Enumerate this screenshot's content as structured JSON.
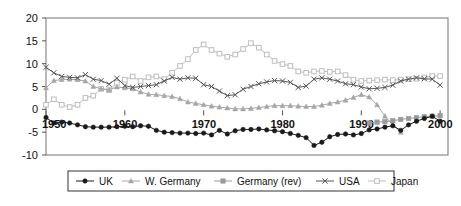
{
  "chart_data": {
    "type": "line",
    "title": "",
    "xlabel": "",
    "ylabel": "",
    "xlim": [
      1950,
      2001
    ],
    "ylim": [
      -10,
      20
    ],
    "yticks": [
      20,
      15,
      10,
      5,
      0,
      -5,
      -10
    ],
    "ytick_labels": [
      "20",
      "15",
      "10",
      "5",
      "0",
      "-5",
      "-10"
    ],
    "xticks": [
      1950,
      1960,
      1970,
      1980,
      1990,
      2000
    ],
    "xtick_labels": [
      "1950",
      "1960",
      "1970",
      "1980",
      "1990",
      "2000"
    ],
    "grid": false,
    "legend_position": "bottom",
    "series": [
      {
        "name": "UK",
        "color": "#1a1a1a",
        "marker": "filled-circle",
        "x": [
          1950,
          1951,
          1952,
          1953,
          1954,
          1955,
          1956,
          1957,
          1958,
          1959,
          1960,
          1961,
          1962,
          1963,
          1964,
          1965,
          1966,
          1967,
          1968,
          1969,
          1970,
          1971,
          1972,
          1973,
          1974,
          1975,
          1976,
          1977,
          1978,
          1979,
          1980,
          1981,
          1982,
          1983,
          1984,
          1985,
          1986,
          1987,
          1988,
          1989,
          1990,
          1991,
          1992,
          1993,
          1994,
          1995,
          1996,
          1997,
          1998,
          1999,
          2000
        ],
        "values": [
          -1.8,
          -3.0,
          -2.8,
          -3.0,
          -3.4,
          -3.8,
          -3.9,
          -3.9,
          -3.9,
          -3.8,
          -3.7,
          -3.8,
          -3.6,
          -3.7,
          -4.6,
          -5.0,
          -5.1,
          -5.2,
          -5.2,
          -5.3,
          -5.2,
          -5.6,
          -4.6,
          -5.4,
          -4.7,
          -4.4,
          -4.4,
          -4.3,
          -4.5,
          -4.7,
          -4.9,
          -5.3,
          -5.7,
          -6.2,
          -7.9,
          -7.2,
          -6.0,
          -5.5,
          -5.4,
          -5.6,
          -5.3,
          -4.5,
          -4.3,
          -3.9,
          -3.6,
          -4.6,
          -3.4,
          -2.6,
          -2.0,
          -1.5,
          -2.6
        ]
      },
      {
        "name": "W. Germany",
        "color": "#a6a6a6",
        "marker": "filled-triangle",
        "x": [
          1950,
          1951,
          1952,
          1953,
          1954,
          1955,
          1956,
          1957,
          1958,
          1959,
          1960,
          1961,
          1962,
          1963,
          1964,
          1965,
          1966,
          1967,
          1968,
          1969,
          1970,
          1971,
          1972,
          1973,
          1974,
          1975,
          1976,
          1977,
          1978,
          1979,
          1980,
          1981,
          1982,
          1983,
          1984,
          1985,
          1986,
          1987,
          1988,
          1989,
          1990,
          1991,
          1992,
          1993,
          1994,
          1995
        ],
        "values": [
          4.7,
          6.3,
          6.5,
          6.6,
          6.5,
          6.2,
          5.0,
          4.5,
          4.3,
          4.9,
          4.7,
          4.5,
          3.8,
          3.3,
          3.2,
          3.0,
          2.8,
          2.3,
          1.6,
          1.3,
          1.0,
          0.7,
          0.5,
          0.3,
          0.1,
          0.1,
          0.2,
          0.4,
          0.6,
          0.8,
          0.8,
          0.8,
          0.7,
          0.6,
          0.6,
          0.9,
          1.3,
          1.6,
          2.0,
          2.6,
          3.2,
          2.7,
          1.0,
          -1.5,
          -3.4,
          -5.0
        ]
      },
      {
        "name": "Germany (rev)",
        "color": "#9a9a9a",
        "marker": "filled-square",
        "x": [
          1991,
          1992,
          1993,
          1994,
          1995,
          1996,
          1997,
          1998,
          1999,
          2000
        ],
        "values": [
          -3.0,
          -2.8,
          -2.7,
          -2.5,
          -2.2,
          -2.0,
          -1.8,
          -1.6,
          -1.5,
          -1.4
        ]
      },
      {
        "name": "USA",
        "color": "#555555",
        "marker": "x-cross",
        "x": [
          1950,
          1951,
          1952,
          1953,
          1954,
          1955,
          1956,
          1957,
          1958,
          1959,
          1960,
          1961,
          1962,
          1963,
          1964,
          1965,
          1966,
          1967,
          1968,
          1969,
          1970,
          1971,
          1972,
          1973,
          1974,
          1975,
          1976,
          1977,
          1978,
          1979,
          1980,
          1981,
          1982,
          1983,
          1984,
          1985,
          1986,
          1987,
          1988,
          1989,
          1990,
          1991,
          1992,
          1993,
          1994,
          1995,
          1996,
          1997,
          1998,
          1999,
          2000
        ],
        "values": [
          9.2,
          8.0,
          7.2,
          7.0,
          6.9,
          7.6,
          6.6,
          6.3,
          5.5,
          6.8,
          5.2,
          4.8,
          5.0,
          5.2,
          5.4,
          6.2,
          7.0,
          6.6,
          6.9,
          6.8,
          5.4,
          5.0,
          4.0,
          3.0,
          3.2,
          4.4,
          5.0,
          5.6,
          6.0,
          6.3,
          6.2,
          5.9,
          4.8,
          5.1,
          6.6,
          6.9,
          6.6,
          6.2,
          5.6,
          5.4,
          4.9,
          4.5,
          4.6,
          4.8,
          5.3,
          6.2,
          6.6,
          6.9,
          6.7,
          6.6,
          5.3
        ]
      },
      {
        "name": "Japan",
        "color": "#bdbdbd",
        "marker": "open-square",
        "x": [
          1950,
          1951,
          1952,
          1953,
          1954,
          1955,
          1956,
          1957,
          1958,
          1959,
          1960,
          1961,
          1962,
          1963,
          1964,
          1965,
          1966,
          1967,
          1968,
          1969,
          1970,
          1971,
          1972,
          1973,
          1974,
          1975,
          1976,
          1977,
          1978,
          1979,
          1980,
          1981,
          1982,
          1983,
          1984,
          1985,
          1986,
          1987,
          1988,
          1989,
          1990,
          1991,
          1992,
          1993,
          1994,
          1995,
          1996,
          1997,
          1998,
          1999,
          2000
        ],
        "values": [
          1.0,
          2.2,
          1.0,
          0.5,
          1.0,
          2.5,
          3.0,
          4.5,
          4.2,
          5.8,
          6.5,
          7.2,
          6.2,
          7.0,
          7.2,
          6.6,
          8.0,
          9.5,
          11.0,
          13.0,
          14.2,
          13.0,
          12.2,
          11.5,
          12.0,
          13.2,
          14.5,
          13.5,
          12.0,
          10.6,
          9.9,
          9.5,
          8.3,
          8.0,
          8.3,
          8.4,
          8.2,
          8.3,
          7.5,
          6.5,
          6.2,
          6.3,
          6.4,
          6.5,
          6.4,
          6.5,
          6.6,
          6.7,
          7.0,
          7.3,
          7.3
        ]
      }
    ]
  },
  "legend": {
    "items": [
      {
        "label": "UK"
      },
      {
        "label": "W. Germany"
      },
      {
        "label": "Germany (rev)"
      },
      {
        "label": "USA"
      },
      {
        "label": "Japan"
      }
    ]
  },
  "axes": {
    "y_labels": [
      "20",
      "15",
      "10",
      "5",
      "0",
      "-5",
      "-10"
    ],
    "x_labels": [
      "1950",
      "1960",
      "1970",
      "1980",
      "1990",
      "2000"
    ]
  }
}
